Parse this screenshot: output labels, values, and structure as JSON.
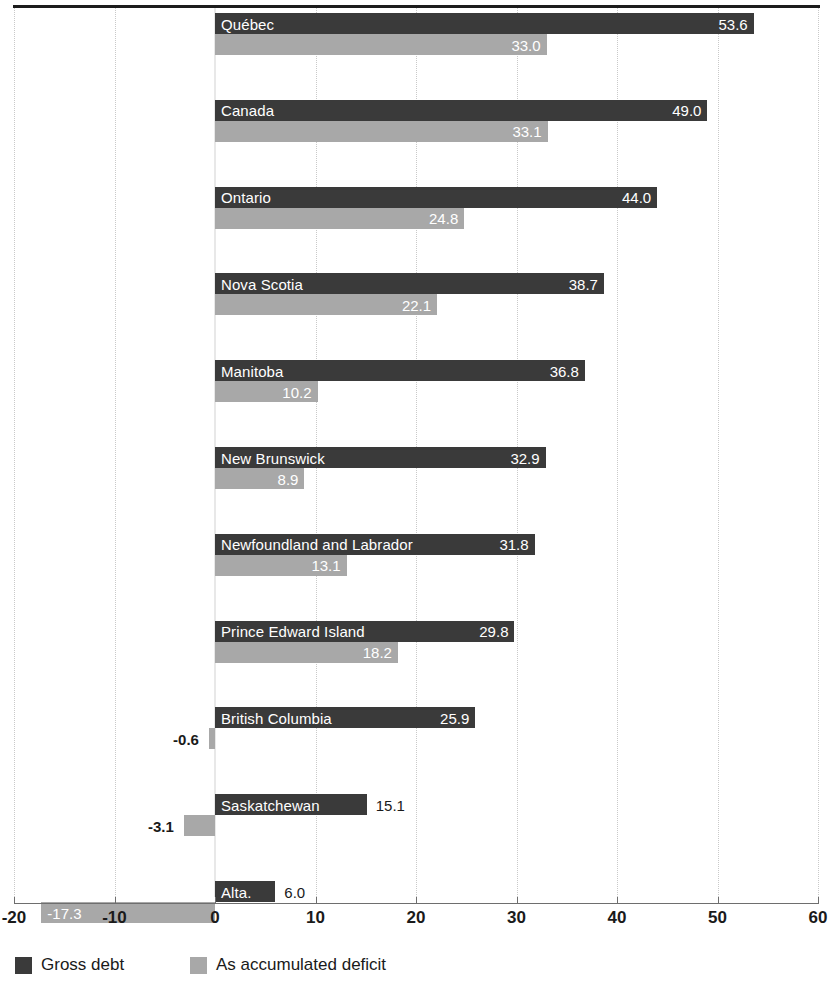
{
  "chart_data": {
    "type": "bar",
    "orientation": "horizontal",
    "title": "",
    "xlabel": "",
    "ylabel": "",
    "xlim": [
      -20,
      60
    ],
    "xticks": [
      -20,
      -10,
      0,
      10,
      20,
      30,
      40,
      50,
      60
    ],
    "xtick_labels": [
      "-20",
      "-10",
      "0",
      "10",
      "20",
      "30",
      "40",
      "50",
      "60"
    ],
    "grid": true,
    "legend_position": "bottom-left",
    "categories": [
      "Québec",
      "Canada",
      "Ontario",
      "Nova Scotia",
      "Manitoba",
      "New Brunswick",
      "Newfoundland and Labrador",
      "Prince Edward Island",
      "British Columbia",
      "Saskatchewan",
      "Alta."
    ],
    "series": [
      {
        "name": "Gross debt",
        "color": "#3a3a3a",
        "values": [
          53.6,
          49.0,
          44.0,
          38.7,
          36.8,
          32.9,
          31.8,
          29.8,
          25.9,
          15.1,
          6.0
        ],
        "value_labels": [
          "53.6",
          "49.0",
          "44.0",
          "38.7",
          "36.8",
          "32.9",
          "31.8",
          "29.8",
          "25.9",
          "15.1",
          "6.0"
        ]
      },
      {
        "name": "As accumulated deficit",
        "color": "#a8a8a8",
        "values": [
          33.0,
          33.1,
          24.8,
          22.1,
          10.2,
          8.9,
          13.1,
          18.2,
          -0.6,
          -3.1,
          -17.3
        ],
        "value_labels": [
          "33.0",
          "33.1",
          "24.8",
          "22.1",
          "10.2",
          "8.9",
          "13.1",
          "18.2",
          "-0.6",
          "-3.1",
          "-17.3"
        ]
      }
    ]
  },
  "legend": {
    "items": [
      {
        "label": "Gross debt",
        "color": "#3a3a3a"
      },
      {
        "label": "As accumulated deficit",
        "color": "#a8a8a8"
      }
    ]
  },
  "axis": {
    "ticks": [
      "-20",
      "-10",
      "0",
      "10",
      "20",
      "30",
      "40",
      "50",
      "60"
    ]
  }
}
